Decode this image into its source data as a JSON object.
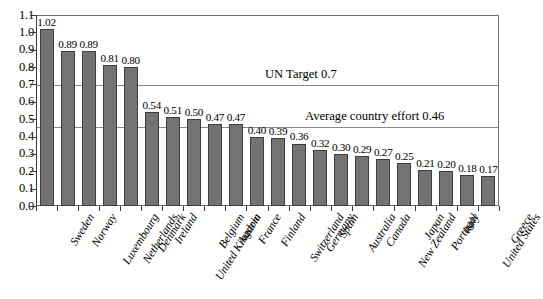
{
  "chart_data": {
    "type": "bar",
    "title": "",
    "subtitle": "",
    "xlabel": "",
    "ylabel": "",
    "ylim": [
      0.0,
      1.1
    ],
    "ytick_step": 0.1,
    "grid": true,
    "legend": "none",
    "bar_color": "#737373",
    "bar_border_color": "#3d3d3d",
    "axis_color": "#3a3a3a",
    "gridline_color": "#8a8a8a",
    "ytick_labels": [
      "1.1",
      "1.0",
      "0.9",
      "0.8",
      "0.7",
      "0.6",
      "0.5",
      "0.4",
      "0.3",
      "0.2",
      "0.1",
      "0.0"
    ],
    "ytick_values": [
      1.1,
      1.0,
      0.9,
      0.8,
      0.7,
      0.6,
      0.5,
      0.4,
      0.3,
      0.2,
      0.1,
      0.0
    ],
    "categories": [
      "Sweden",
      "Norway",
      "Luxembourg",
      "Netherlands",
      "Denmark",
      "Ireland",
      "United Kingdom",
      "Belgium",
      "Austria",
      "France",
      "Finland",
      "Switzerland",
      "Germany",
      "Spain",
      "Australia",
      "Canada",
      "New Zealand",
      "Japan",
      "Portugal",
      "Italy",
      "United States",
      "Greece"
    ],
    "values": [
      1.02,
      0.89,
      0.89,
      0.81,
      0.8,
      0.54,
      0.51,
      0.5,
      0.47,
      0.47,
      0.4,
      0.39,
      0.36,
      0.32,
      0.3,
      0.29,
      0.27,
      0.25,
      0.21,
      0.2,
      0.18,
      0.17
    ],
    "value_labels": [
      "1.02",
      "0.89",
      "0.89",
      "0.81",
      "0.80",
      "0.54",
      "0.51",
      "0.50",
      "0.47",
      "0.47",
      "0.40",
      "0.39",
      "0.36",
      "0.32",
      "0.30",
      "0.29",
      "0.27",
      "0.25",
      "0.21",
      "0.20",
      "0.18",
      "0.17"
    ],
    "reference_lines": [
      {
        "label": "UN Target 0.7",
        "value": 0.7
      },
      {
        "label": "Average country effort 0.46",
        "value": 0.46
      }
    ]
  }
}
